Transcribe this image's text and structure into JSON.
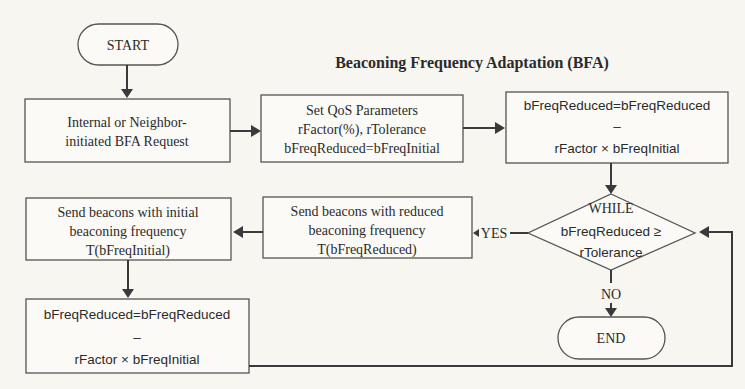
{
  "title": "Beaconing Frequency Adaptation (BFA)",
  "nodes": {
    "start": {
      "label": "START"
    },
    "request": {
      "lines": [
        "Internal or Neighbor-",
        "initiated BFA Request"
      ]
    },
    "set_qos": {
      "lines": [
        "Set QoS Parameters",
        "rFactor(%), rTolerance",
        "bFreqReduced=bFreqInitial"
      ]
    },
    "reduce_top": {
      "lines": [
        "bFreqReduced=bFreqReduced",
        "–",
        "rFactor × bFreqInitial"
      ]
    },
    "while": {
      "lines": [
        "WHILE",
        "bFreqReduced ≥",
        "rTolerance"
      ]
    },
    "send_reduced": {
      "lines": [
        "Send beacons with reduced",
        "beaconing frequency",
        "T(bFreqReduced)"
      ]
    },
    "send_initial": {
      "lines": [
        "Send beacons with initial",
        "beaconing frequency",
        "T(bFreqInitial)"
      ]
    },
    "reduce_bottom": {
      "lines": [
        "bFreqReduced=bFreqReduced",
        "–",
        "rFactor × bFreqInitial"
      ]
    },
    "end": {
      "label": "END"
    }
  },
  "edges": {
    "yes_label": "YES",
    "no_label": "NO"
  },
  "colors": {
    "background": "#f7f6f1",
    "stroke": "#555555",
    "text": "#2b2b2b"
  }
}
